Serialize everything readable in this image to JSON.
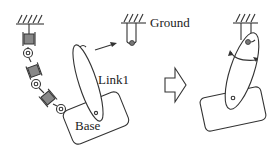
{
  "diagram": {
    "labels": {
      "ground": "Ground",
      "link1": "Link1",
      "base": "Base"
    },
    "colors": {
      "stroke": "#333333",
      "joint_fill": "#888888",
      "background": "#ffffff"
    },
    "elements": [
      "serial-chain-with-prismatic-and-revolute-joints",
      "ground-anchor",
      "link1-ellipse",
      "base-rectangle",
      "transition-arrow",
      "assembled-link-with-rotation-arrows"
    ]
  }
}
